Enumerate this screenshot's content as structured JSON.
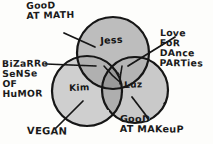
{
  "diagram": {
    "type": "venn-3-set",
    "title_present": false,
    "background_color": "#fdfdfb",
    "ink_color": "#1a1a1a",
    "sets": [
      {
        "id": "jess",
        "label": "Jess",
        "fill_color": "#bdbdbd",
        "position": "top"
      },
      {
        "id": "kim",
        "label": "Kim",
        "fill_color": "#cfcfcf",
        "position": "bottom-left"
      },
      {
        "id": "luz",
        "label": "Luz",
        "fill_color": "#c9c9c9",
        "position": "bottom-right"
      }
    ],
    "annotations": [
      {
        "id": "good-at-math",
        "text": "GooD\nAT MATH",
        "points_to": "jess",
        "corner": "top-left"
      },
      {
        "id": "bizarre-humor",
        "text": "BiZaRRe\nSeNSe\nOF\nHuMOR",
        "points_to": "jess-kim-overlap",
        "corner": "left"
      },
      {
        "id": "vegan",
        "text": "VEGAN",
        "points_to": "kim",
        "corner": "bottom-left"
      },
      {
        "id": "love-dance",
        "text": "Love\nFoR\nDAnce\nPARTies",
        "points_to": "jess-luz-overlap",
        "corner": "right"
      },
      {
        "id": "good-at-makeup",
        "text": "GooD\nAT MAKeuP",
        "points_to": "luz",
        "corner": "bottom-right"
      }
    ]
  }
}
